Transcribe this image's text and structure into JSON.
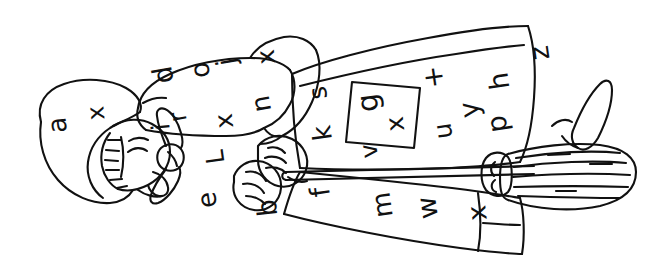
{
  "image": {
    "title": "Line drawing of a person with a broom, sideways orientation",
    "style": "black-and-white hand-drawn coloring-page outline",
    "width": 654,
    "height": 275,
    "background_color": "#ffffff",
    "ink_color": "#111111",
    "orientation_note": "figure rotated roughly 90 degrees, head at left, broom at right"
  },
  "letters": [
    {
      "char": "a",
      "x": 57,
      "y": 125,
      "size": 26,
      "rotate": -95
    },
    {
      "char": "x",
      "x": 96,
      "y": 113,
      "size": 24,
      "rotate": -95
    },
    {
      "char": "d",
      "x": 163,
      "y": 75,
      "size": 27,
      "rotate": -100
    },
    {
      "char": "o",
      "x": 200,
      "y": 70,
      "size": 26,
      "rotate": -98
    },
    {
      "char": "j",
      "x": 226,
      "y": 62,
      "size": 27,
      "rotate": -100
    },
    {
      "char": "x",
      "x": 266,
      "y": 57,
      "size": 25,
      "rotate": -96
    },
    {
      "char": "i",
      "x": 161,
      "y": 127,
      "size": 25,
      "rotate": -96
    },
    {
      "char": "r",
      "x": 178,
      "y": 117,
      "size": 24,
      "rotate": -100
    },
    {
      "char": "x",
      "x": 224,
      "y": 121,
      "size": 25,
      "rotate": -96
    },
    {
      "char": "n",
      "x": 261,
      "y": 104,
      "size": 26,
      "rotate": -100
    },
    {
      "char": "L",
      "x": 215,
      "y": 157,
      "size": 25,
      "rotate": -98
    },
    {
      "char": "e",
      "x": 207,
      "y": 200,
      "size": 26,
      "rotate": -98
    },
    {
      "char": "b",
      "x": 267,
      "y": 208,
      "size": 27,
      "rotate": -96
    },
    {
      "char": "s",
      "x": 318,
      "y": 93,
      "size": 25,
      "rotate": -98
    },
    {
      "char": "k",
      "x": 322,
      "y": 133,
      "size": 26,
      "rotate": -98
    },
    {
      "char": "g",
      "x": 368,
      "y": 103,
      "size": 29,
      "rotate": -98
    },
    {
      "char": "x",
      "x": 395,
      "y": 124,
      "size": 25,
      "rotate": -96
    },
    {
      "char": "v",
      "x": 369,
      "y": 151,
      "size": 24,
      "rotate": -98
    },
    {
      "char": "f",
      "x": 320,
      "y": 192,
      "size": 27,
      "rotate": -98
    },
    {
      "char": "+",
      "x": 433,
      "y": 77,
      "size": 27,
      "rotate": -98
    },
    {
      "char": "y",
      "x": 469,
      "y": 110,
      "size": 27,
      "rotate": -98
    },
    {
      "char": "u",
      "x": 443,
      "y": 131,
      "size": 25,
      "rotate": -98
    },
    {
      "char": "h",
      "x": 499,
      "y": 81,
      "size": 27,
      "rotate": -98
    },
    {
      "char": "p",
      "x": 497,
      "y": 124,
      "size": 27,
      "rotate": -98
    },
    {
      "char": "z",
      "x": 539,
      "y": 53,
      "size": 27,
      "rotate": -98
    },
    {
      "char": "m",
      "x": 382,
      "y": 205,
      "size": 26,
      "rotate": -98
    },
    {
      "char": "w",
      "x": 427,
      "y": 208,
      "size": 27,
      "rotate": -98
    },
    {
      "char": "x",
      "x": 477,
      "y": 213,
      "size": 26,
      "rotate": -96
    }
  ],
  "regions": [
    {
      "name": "hood",
      "label": "hood / head covering at left"
    },
    {
      "name": "face",
      "label": "face in profile with closed eye and hatched hair"
    },
    {
      "name": "shoulder-cape",
      "label": "shoulder cape panel"
    },
    {
      "name": "collar-knot",
      "label": "knotted collar tie"
    },
    {
      "name": "sleeve",
      "label": "raised arm sleeve"
    },
    {
      "name": "hand-upper",
      "label": "upper hand gripping broom handle"
    },
    {
      "name": "hand-lower",
      "label": "lower hand gripping broom handle"
    },
    {
      "name": "torso",
      "label": "main robe / torso panel"
    },
    {
      "name": "pocket-box",
      "label": "rectangular pocket containing letters g and x"
    },
    {
      "name": "skirt",
      "label": "lower robe / skirt panel"
    },
    {
      "name": "broom-handle",
      "label": "long broom handle running left to right"
    },
    {
      "name": "broom-head",
      "label": "broom bristle head at right"
    },
    {
      "name": "shoe",
      "label": "pointed shoe at far right"
    }
  ]
}
